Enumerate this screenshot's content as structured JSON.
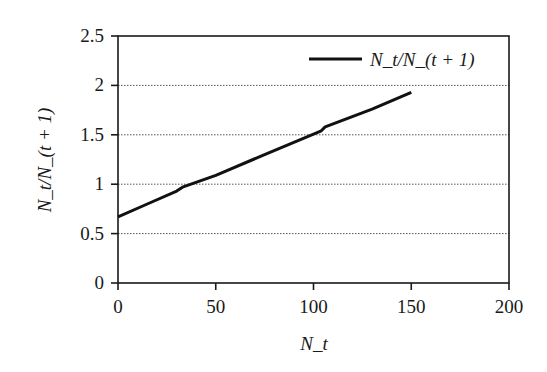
{
  "chart_data": {
    "type": "line",
    "title": "",
    "xlabel": "N_t",
    "ylabel": "N_t/N_(t + 1)",
    "xlim": [
      0,
      200
    ],
    "ylim": [
      0,
      2.5
    ],
    "x_ticks": [
      0,
      50,
      100,
      150,
      200
    ],
    "x_tick_labels": [
      "0",
      "50",
      "100",
      "150",
      "200"
    ],
    "y_ticks": [
      0,
      0.5,
      1,
      1.5,
      2,
      2.5
    ],
    "y_tick_labels": [
      "0",
      "0.5",
      "1",
      "1.5",
      "2",
      "2.5"
    ],
    "grid": {
      "y": true,
      "x": false,
      "style": "dotted"
    },
    "legend": {
      "position": "upper right",
      "entries": [
        "N_t/N_(t + 1)"
      ]
    },
    "series": [
      {
        "name": "N_t/N_(t + 1)",
        "color": "#111111",
        "x": [
          0,
          15,
          30,
          33,
          50,
          75,
          104,
          106,
          130,
          150
        ],
        "y": [
          0.67,
          0.8,
          0.93,
          0.97,
          1.09,
          1.3,
          1.54,
          1.58,
          1.76,
          1.93
        ]
      }
    ]
  },
  "colors": {
    "axis": "#1a1a1a",
    "grid": "#555555",
    "line": "#111111",
    "background": "#ffffff"
  }
}
